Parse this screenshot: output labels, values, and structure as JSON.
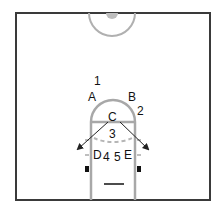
{
  "diagram": {
    "type": "basketball-half-court-play",
    "colors": {
      "border": "#3a3a3a",
      "lane": "#a8a8a8",
      "text": "#111111",
      "arrow": "#222222",
      "center_fill": "#bdbdbd"
    },
    "labels": {
      "one": "1",
      "two": "2",
      "three": "3",
      "four": "4",
      "five": "5",
      "a": "A",
      "b": "B",
      "c": "C",
      "d": "D",
      "e": "E"
    }
  }
}
